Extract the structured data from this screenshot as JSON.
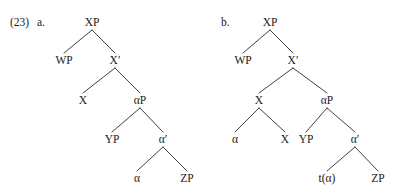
{
  "figure": {
    "example_number": "(23)",
    "background_color": "#ffffff",
    "text_color": "#1a1a1a",
    "line_color": "#2b2b2b"
  },
  "trees": [
    {
      "label": "a.",
      "label_x": 37,
      "label_y": 26,
      "description": "base structure with alpha in situ",
      "nodes": [
        {
          "id": "a-xp",
          "text": "XP",
          "x": 92,
          "y": 26
        },
        {
          "id": "a-wp",
          "text": "WP",
          "x": 64,
          "y": 64
        },
        {
          "id": "a-xbar",
          "text": "X′",
          "x": 115,
          "y": 64
        },
        {
          "id": "a-x",
          "text": "X",
          "x": 83,
          "y": 104
        },
        {
          "id": "a-alphap",
          "text": "αP",
          "x": 140,
          "y": 104
        },
        {
          "id": "a-yp",
          "text": "YP",
          "x": 112,
          "y": 143
        },
        {
          "id": "a-alphabar",
          "text": "α′",
          "x": 163,
          "y": 143
        },
        {
          "id": "a-alpha",
          "text": "α",
          "x": 137,
          "y": 182
        },
        {
          "id": "a-zp",
          "text": "ZP",
          "x": 187,
          "y": 182
        }
      ],
      "edges": [
        {
          "from": "a-xp",
          "to": "a-wp"
        },
        {
          "from": "a-xp",
          "to": "a-xbar"
        },
        {
          "from": "a-xbar",
          "to": "a-x"
        },
        {
          "from": "a-xbar",
          "to": "a-alphap"
        },
        {
          "from": "a-alphap",
          "to": "a-yp"
        },
        {
          "from": "a-alphap",
          "to": "a-alphabar"
        },
        {
          "from": "a-alphabar",
          "to": "a-alpha"
        },
        {
          "from": "a-alphabar",
          "to": "a-zp"
        }
      ]
    },
    {
      "label": "b.",
      "label_x": 221,
      "label_y": 26,
      "description": "derived structure with head movement of alpha and trace",
      "nodes": [
        {
          "id": "b-xp",
          "text": "XP",
          "x": 270,
          "y": 26
        },
        {
          "id": "b-wp",
          "text": "WP",
          "x": 243,
          "y": 64
        },
        {
          "id": "b-xbar",
          "text": "X′",
          "x": 293,
          "y": 64
        },
        {
          "id": "b-x",
          "text": "X",
          "x": 259,
          "y": 104
        },
        {
          "id": "b-alphap",
          "text": "αP",
          "x": 327,
          "y": 104
        },
        {
          "id": "b-alpha",
          "text": "α",
          "x": 235,
          "y": 143
        },
        {
          "id": "b-x2",
          "text": "X",
          "x": 285,
          "y": 143
        },
        {
          "id": "b-yp",
          "text": "YP",
          "x": 306,
          "y": 143
        },
        {
          "id": "b-alphabar",
          "text": "α′",
          "x": 355,
          "y": 143
        },
        {
          "id": "b-trace",
          "text": "t(α)",
          "x": 327,
          "y": 182
        },
        {
          "id": "b-zp",
          "text": "ZP",
          "x": 378,
          "y": 182
        }
      ],
      "edges": [
        {
          "from": "b-xp",
          "to": "b-wp"
        },
        {
          "from": "b-xp",
          "to": "b-xbar"
        },
        {
          "from": "b-xbar",
          "to": "b-x"
        },
        {
          "from": "b-xbar",
          "to": "b-alphap"
        },
        {
          "from": "b-x",
          "to": "b-alpha"
        },
        {
          "from": "b-x",
          "to": "b-x2"
        },
        {
          "from": "b-alphap",
          "to": "b-yp"
        },
        {
          "from": "b-alphap",
          "to": "b-alphabar"
        },
        {
          "from": "b-alphabar",
          "to": "b-trace"
        },
        {
          "from": "b-alphabar",
          "to": "b-zp"
        }
      ]
    }
  ]
}
